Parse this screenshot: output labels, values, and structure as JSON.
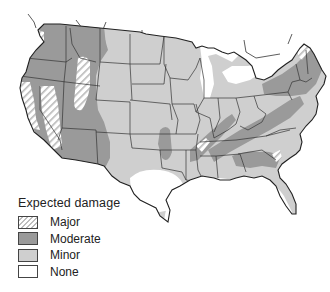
{
  "map": {
    "subject": "Contiguous United States",
    "colors": {
      "major_fill": "#ffffff",
      "major_hatch": "#bdbdbd",
      "moderate": "#9a9a9a",
      "minor": "#cfcfcf",
      "none": "#ffffff",
      "border": "#333333"
    }
  },
  "legend": {
    "title": "Expected damage",
    "items": [
      {
        "key": "major",
        "label": "Major"
      },
      {
        "key": "moderate",
        "label": "Moderate"
      },
      {
        "key": "minor",
        "label": "Minor"
      },
      {
        "key": "none",
        "label": "None"
      }
    ]
  }
}
